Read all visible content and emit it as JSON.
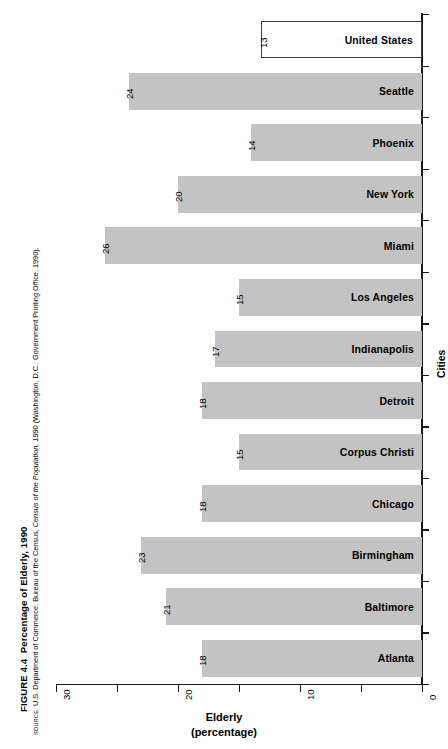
{
  "figure": {
    "number": "FIGURE 4.4",
    "title": "Percentage of Elderly, 1990",
    "source_kicker": "SOURCE:",
    "source_pre": " U.S. Department of Commerce, Bureau of the Census, ",
    "source_italic": "Census of the Population, 1990",
    "source_post": " (Washington, D.C.: Government Printing Office, 1990)."
  },
  "chart_data": {
    "type": "bar",
    "orientation": "horizontal",
    "title": "Percentage of Elderly, 1990",
    "xlabel": "Elderly",
    "xlabel_sub": "(percentage)",
    "ylabel": "Cities",
    "xlim": [
      30,
      0
    ],
    "x_reversed": true,
    "grid": false,
    "legend": "none",
    "xticks": [
      30,
      25,
      20,
      15,
      10,
      5,
      0
    ],
    "xtick_labels": [
      "30",
      "",
      "20",
      "",
      "10",
      "",
      "0"
    ],
    "categories": [
      "United States",
      "Seattle",
      "Phoenix",
      "New York",
      "Miami",
      "Los Angeles",
      "Indianapolis",
      "Detroit",
      "Corpus Christi",
      "Chicago",
      "Birmingham",
      "Baltimore",
      "Atlanta"
    ],
    "values": [
      13,
      24,
      14,
      20,
      26,
      15,
      17,
      18,
      15,
      18,
      23,
      21,
      18
    ],
    "value_labels": [
      "13",
      "24",
      "14",
      "20",
      "26",
      "15",
      "17",
      "18",
      "15",
      "18",
      "23",
      "21",
      "18"
    ],
    "bar_fill": "#c3c3c3",
    "highlight_category": "United States",
    "highlight_fill": "#ffffff",
    "highlight_stroke": "#3d3d3d"
  }
}
